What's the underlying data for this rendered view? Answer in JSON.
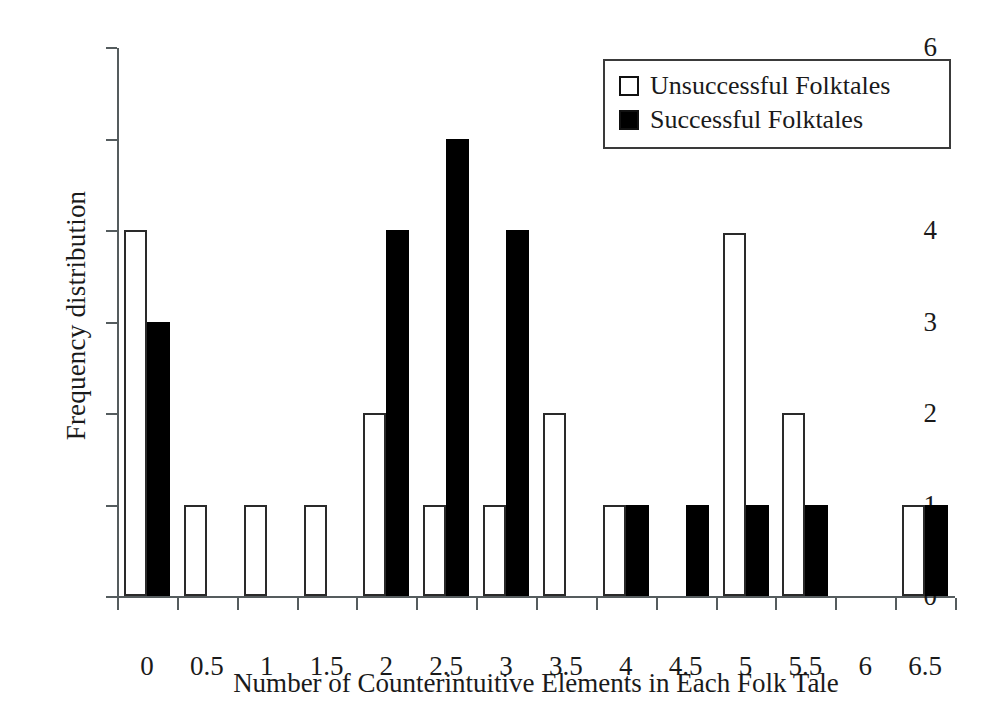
{
  "chart_data": {
    "type": "bar",
    "title": "",
    "xlabel": "Number of Counterintuitive Elements in Each Folk Tale",
    "ylabel": "Frequency distribution",
    "categories": [
      "0",
      "0.5",
      "1",
      "1.5",
      "2",
      "2.5",
      "3",
      "3.5",
      "4",
      "4.5",
      "5",
      "5.5",
      "6",
      "6.5"
    ],
    "xticklabels": [
      "0",
      "0.5",
      "1",
      "1.5",
      "2",
      "2.5",
      "3",
      "3.5",
      "4",
      "4.5",
      "5",
      "5.5",
      "6",
      "6.5"
    ],
    "yticklabels": [
      "0",
      "1",
      "2",
      "3",
      "4",
      "5",
      "6"
    ],
    "ylim": [
      0,
      6
    ],
    "grid": false,
    "legend_position": "top-right",
    "series": [
      {
        "name": "Unsuccessful Folktales",
        "style": "open",
        "color": "#ffffff",
        "edgecolor": "#2a2a2a",
        "values": [
          4,
          1,
          1,
          1,
          2,
          1,
          1,
          2,
          1,
          0,
          3.97,
          2,
          0,
          1
        ]
      },
      {
        "name": "Successful Folktales",
        "style": "filled",
        "color": "#000000",
        "edgecolor": "#000000",
        "values": [
          3,
          0,
          0,
          0,
          4,
          5,
          4,
          0,
          1,
          1,
          1,
          1,
          0,
          1
        ]
      }
    ]
  },
  "legend": {
    "items": [
      {
        "label": "Unsuccessful Folktales",
        "style": "open"
      },
      {
        "label": "Successful Folktales",
        "style": "filled"
      }
    ]
  }
}
